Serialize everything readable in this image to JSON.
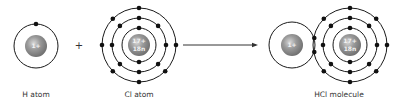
{
  "colors": {
    "background": "#ffffff",
    "line": "#1a1a1a",
    "electron": "#111111",
    "nucleus": "#8a8a8a",
    "nucleus_highlight": "#cfcfcf",
    "label": "#333333"
  },
  "operators": {
    "plus": "+"
  },
  "h_atom": {
    "label": "H atom",
    "nucleus_charge": "1+",
    "shells": [
      {
        "electrons": 1
      }
    ]
  },
  "cl_atom": {
    "label": "Cl atom",
    "nucleus_charge": "17+",
    "nucleus_neutrons": "18n",
    "shells": [
      {
        "electrons": 2
      },
      {
        "electrons": 8
      },
      {
        "electrons": 7
      }
    ]
  },
  "hcl_molecule": {
    "label": "HCl molecule",
    "h_nucleus_charge": "1+",
    "cl_nucleus_charge": "17+",
    "cl_nucleus_neutrons": "18n",
    "shared_pair_electrons": 2,
    "cl_shells": [
      {
        "electrons": 2
      },
      {
        "electrons": 8
      },
      {
        "electrons": 8
      }
    ]
  },
  "arrow": {
    "direction": "right"
  }
}
